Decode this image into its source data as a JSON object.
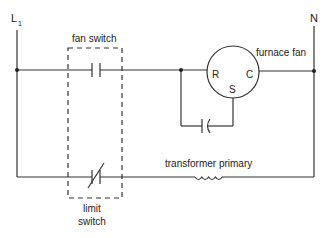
{
  "labels": {
    "line": "L",
    "line_sub": "1",
    "neutral": "N",
    "fan_switch": "fan switch",
    "furnace_fan": "furnace fan",
    "motor_r": "R",
    "motor_c": "C",
    "motor_s": "S",
    "transformer_primary": "transformer primary",
    "limit_switch_1": "limit",
    "limit_switch_2": "switch"
  },
  "colors": {
    "wire": "#333333",
    "text": "#222222",
    "background": "#ffffff"
  }
}
